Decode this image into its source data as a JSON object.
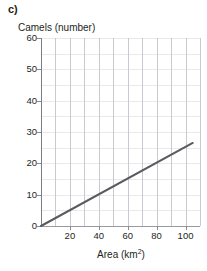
{
  "part_label": "c)",
  "chart_data": {
    "type": "line",
    "title": "",
    "xlabel": "Area (km²)",
    "xlabel_base": "Area (km",
    "xlabel_sup": "2",
    "xlabel_close": ")",
    "ylabel": "Camels (number)",
    "xlim": [
      0,
      110
    ],
    "ylim": [
      0,
      60
    ],
    "xticks": [
      20,
      40,
      60,
      80,
      100
    ],
    "xtick_labels": [
      "20",
      "40",
      "60",
      "80",
      "100"
    ],
    "yticks": [
      0,
      10,
      20,
      30,
      40,
      50,
      60
    ],
    "ytick_labels": [
      "0",
      "10",
      "20",
      "30",
      "40",
      "50",
      "60"
    ],
    "x_minor_step": 10,
    "y_minor_step": 5,
    "grid": true,
    "legend": "none",
    "series": [
      {
        "name": "camels vs area",
        "points": [
          [
            0,
            0
          ],
          [
            105,
            26.5
          ]
        ],
        "slope": 0.2524,
        "color": "#5a5a5f"
      }
    ]
  },
  "colors": {
    "line": "#5a5a5f",
    "vgrid": "#c9c9cf",
    "hgrid": "#e9e9ec",
    "axis": "#8a8a91",
    "text": "#231f20"
  }
}
